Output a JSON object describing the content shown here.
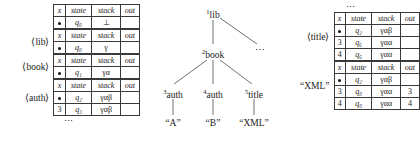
{
  "columns": [
    "x",
    "state",
    "stack",
    "out"
  ],
  "left_section": {
    "blocks": [
      {
        "label": "",
        "rows": [
          {
            "x": "●",
            "state": "q₀",
            "stack": "⊥",
            "out": ""
          }
        ]
      },
      {
        "label": "⟨lib⟩",
        "rows": [
          {
            "x": "●",
            "state": "q₀",
            "stack": "γ",
            "out": ""
          }
        ]
      },
      {
        "label": "⟨book⟩",
        "rows": [
          {
            "x": "●",
            "state": "q₁",
            "stack": "γα",
            "out": ""
          }
        ]
      },
      {
        "label": "⟨auth⟩",
        "rows": [
          {
            "x": "●",
            "state": "q₂",
            "stack": "γαβ",
            "out": ""
          },
          {
            "x": "3",
            "state": "q₃",
            "stack": "γαβ",
            "out": ""
          }
        ]
      }
    ],
    "bottom_ellipsis": "⋯"
  },
  "right_section": {
    "top_ellipsis": "⋯",
    "blocks": [
      {
        "label": "⟨title⟩",
        "rows": [
          {
            "x": "●",
            "state": "q₂",
            "stack": "γαβ",
            "out": ""
          },
          {
            "x": "3",
            "state": "q₆",
            "stack": "γαα",
            "out": ""
          },
          {
            "x": "4",
            "state": "q₆",
            "stack": "γαα",
            "out": ""
          }
        ]
      },
      {
        "label": "“XML”",
        "rows": [
          {
            "x": "●",
            "state": "q₂",
            "stack": "γαβ",
            "out": ""
          },
          {
            "x": "3",
            "state": "q₀",
            "stack": "γαα",
            "out": "3"
          },
          {
            "x": "4",
            "state": "q₀",
            "stack": "γαα",
            "out": "4"
          }
        ]
      }
    ]
  },
  "tree": {
    "nodes": [
      {
        "id": "lib",
        "index": "1",
        "label": "lib",
        "x": 62,
        "y": 8
      },
      {
        "id": "dots",
        "index": "",
        "label": "⋯",
        "x": 110,
        "y": 48
      },
      {
        "id": "book",
        "index": "2",
        "label": "book",
        "x": 62,
        "y": 48
      },
      {
        "id": "auth1",
        "index": "3",
        "label": "auth",
        "x": 22,
        "y": 88
      },
      {
        "id": "auth2",
        "index": "4",
        "label": "auth",
        "x": 62,
        "y": 88
      },
      {
        "id": "title",
        "index": "5",
        "label": "title",
        "x": 104,
        "y": 88
      },
      {
        "id": "leafA",
        "index": "",
        "label": "“A”",
        "x": 22,
        "y": 120
      },
      {
        "id": "leafB",
        "index": "",
        "label": "“B”",
        "x": 62,
        "y": 120
      },
      {
        "id": "leafX",
        "index": "",
        "label": "“XML”",
        "x": 104,
        "y": 120
      }
    ],
    "edges": [
      {
        "from": "lib",
        "to": "book",
        "x1": 63,
        "y1": 20,
        "x2": 63,
        "y2": 44
      },
      {
        "from": "lib",
        "to": "dots",
        "x1": 70,
        "y1": 18,
        "x2": 107,
        "y2": 44
      },
      {
        "from": "book",
        "to": "auth1",
        "x1": 57,
        "y1": 60,
        "x2": 24,
        "y2": 84
      },
      {
        "from": "book",
        "to": "auth2",
        "x1": 63,
        "y1": 60,
        "x2": 63,
        "y2": 84
      },
      {
        "from": "book",
        "to": "title",
        "x1": 70,
        "y1": 60,
        "x2": 102,
        "y2": 84
      },
      {
        "from": "auth1",
        "to": "leafA",
        "x1": 23,
        "y1": 99,
        "x2": 23,
        "y2": 115
      },
      {
        "from": "auth2",
        "to": "leafB",
        "x1": 63,
        "y1": 99,
        "x2": 63,
        "y2": 115
      },
      {
        "from": "title",
        "to": "leafX",
        "x1": 104,
        "y1": 99,
        "x2": 104,
        "y2": 115
      }
    ]
  },
  "colors": {
    "ink": "#1a1a1a",
    "rule": "#3a3a3a",
    "background": "#ffffff"
  }
}
